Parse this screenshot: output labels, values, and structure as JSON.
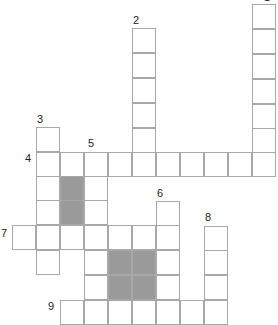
{
  "puzzle": {
    "type": "crossword",
    "cell_size": 24,
    "colors": {
      "border": "#a8a8a8",
      "shaded": "#9a9a9a",
      "background": "#ffffff",
      "number": "#222222"
    },
    "words": [
      {
        "number": "1",
        "direction": "down",
        "length": 7
      },
      {
        "number": "2",
        "direction": "down",
        "length": 6
      },
      {
        "number": "3",
        "direction": "down",
        "length": 6
      },
      {
        "number": "4",
        "direction": "across",
        "length": 10
      },
      {
        "number": "5",
        "direction": "down",
        "length": 7
      },
      {
        "number": "6",
        "direction": "down",
        "length": 5
      },
      {
        "number": "7",
        "direction": "across",
        "length": 7
      },
      {
        "number": "8",
        "direction": "down",
        "length": 4
      },
      {
        "number": "9",
        "direction": "across",
        "length": 9
      }
    ],
    "labels": [
      {
        "text": "1",
        "x": 264,
        "y": -8
      },
      {
        "text": "2",
        "x": 133,
        "y": 15
      },
      {
        "text": "3",
        "x": 37,
        "y": 114
      },
      {
        "text": "4",
        "x": 25,
        "y": 153
      },
      {
        "text": "5",
        "x": 88,
        "y": 138
      },
      {
        "text": "6",
        "x": 157,
        "y": 188
      },
      {
        "text": "7",
        "x": 1,
        "y": 228
      },
      {
        "text": "8",
        "x": 205,
        "y": 212
      },
      {
        "text": "9",
        "x": 48,
        "y": 301
      }
    ]
  }
}
